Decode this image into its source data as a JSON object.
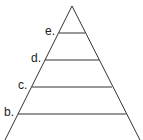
{
  "diagram": {
    "type": "pyramid",
    "apex": [
      72,
      6
    ],
    "base_left": [
      4,
      142
    ],
    "base_right": [
      141,
      142
    ],
    "line_color": "#333333",
    "levels": [
      {
        "label": "e.",
        "y": 33,
        "x1": 59,
        "x2": 85,
        "label_x": 45,
        "label_y": 25
      },
      {
        "label": "d.",
        "y": 60,
        "x1": 45,
        "x2": 99,
        "label_x": 31,
        "label_y": 52
      },
      {
        "label": "c.",
        "y": 87,
        "x1": 32,
        "x2": 112,
        "label_x": 18,
        "label_y": 79
      },
      {
        "label": "b.",
        "y": 114,
        "x1": 18,
        "x2": 126,
        "label_x": 4,
        "label_y": 106
      }
    ]
  }
}
